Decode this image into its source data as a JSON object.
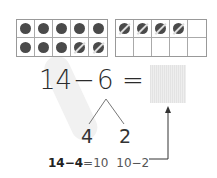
{
  "ten_frames": [
    {
      "name": "left-ten-frame",
      "cells": [
        "filled",
        "filled",
        "filled",
        "filled",
        "filled",
        "filled",
        "filled",
        "filled",
        "crossed",
        "crossed"
      ]
    },
    {
      "name": "right-ten-frame",
      "cells": [
        "crossed",
        "crossed",
        "crossed",
        "crossed",
        "empty",
        "empty",
        "empty",
        "empty",
        "empty",
        "empty"
      ]
    }
  ],
  "equation": {
    "minuend": "14",
    "operator": "−",
    "subtrahend": "6",
    "equals": "=",
    "answer": ""
  },
  "number_bond": {
    "parts": [
      "4",
      "2"
    ]
  },
  "steps": {
    "step1_left": "14−4",
    "step1_right": "=10",
    "step2": "10−2"
  },
  "colors": {
    "dot": "#4a4a4a",
    "answer_box": "#eaeaea",
    "highlight": "#f1f1f1"
  }
}
